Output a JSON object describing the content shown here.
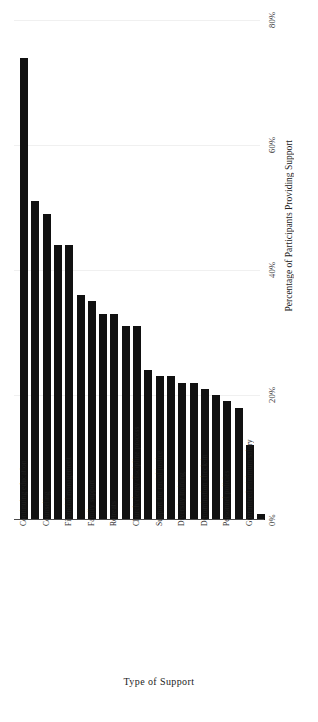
{
  "chart_data": {
    "type": "bar",
    "title": "",
    "xlabel": "Type  of Support",
    "ylabel": "Percentage of Participants Providing Support",
    "ylim": [
      0,
      80
    ],
    "yticks": [
      0,
      20,
      40,
      60,
      80
    ],
    "ytick_labels": [
      "0%",
      "20%",
      "40%",
      "60%",
      "80%"
    ],
    "grid": true,
    "legend": "none",
    "bar_color": "#111111",
    "categories": [
      "Continuing education",
      "",
      "Counseling",
      "",
      "Financial management",
      "",
      "Family support",
      "",
      "Retreats",
      "",
      "Church/clergy discipline process",
      "",
      "Support for racial justice",
      "",
      "Diversity training",
      "",
      "Denomination check-in",
      "",
      "Personnel policies",
      "",
      "Guaranteed minimum salary",
      ""
    ],
    "labeled_categories": [
      "Continuing education",
      "Counseling",
      "Financial management",
      "Family support",
      "Retreats",
      "Church/clergy discipline process",
      "Support for racial justice",
      "Diversity training",
      "Denomination check-in",
      "Personnel policies",
      "Guaranteed minimum salary"
    ],
    "values": [
      74,
      51,
      49,
      44,
      44,
      36,
      35,
      33,
      33,
      31,
      31,
      24,
      23,
      23,
      22,
      22,
      21,
      20,
      19,
      18,
      12,
      1
    ]
  },
  "axes": {
    "y_title": "Percentage of Participants Providing Support",
    "x_title": "Type  of Support"
  }
}
